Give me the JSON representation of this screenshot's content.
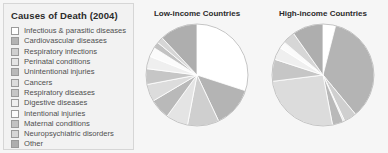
{
  "legend": {
    "title": "Causes of Death (2004)",
    "items": [
      {
        "label": "Infectious & parasitic diseases",
        "color": "#ffffff"
      },
      {
        "label": "Cardiovascular diseases",
        "color": "#b4b4b4"
      },
      {
        "label": "Respiratory infections",
        "color": "#cfcfcf"
      },
      {
        "label": "Perinatal conditions",
        "color": "#e4e4e4"
      },
      {
        "label": "Unintentional injuries",
        "color": "#b9b9b9"
      },
      {
        "label": "Cancers",
        "color": "#dcdcdc"
      },
      {
        "label": "Respiratory diseases",
        "color": "#c6c6c6"
      },
      {
        "label": "Digestive diseases",
        "color": "#efefef"
      },
      {
        "label": "Intentional injuries",
        "color": "#fbfbfb"
      },
      {
        "label": "Maternal conditions",
        "color": "#c2c2c2"
      },
      {
        "label": "Neuropsychiatric disorders",
        "color": "#d6d6d6"
      },
      {
        "label": "Other",
        "color": "#aeaeae"
      }
    ]
  },
  "charts": [
    {
      "id": "low-income",
      "title": "Low-income Countries",
      "center": [
        61,
        52
      ],
      "radius": 51
    },
    {
      "id": "high-income",
      "title": "High-income Countries",
      "center": [
        61,
        52
      ],
      "radius": 51
    }
  ],
  "chart_data": [
    {
      "type": "pie",
      "title": "Low-income Countries",
      "categories": [
        "Infectious & parasitic diseases",
        "Cardiovascular diseases",
        "Respiratory infections",
        "Perinatal conditions",
        "Unintentional injuries",
        "Cancers",
        "Respiratory diseases",
        "Digestive diseases",
        "Intentional injuries",
        "Maternal conditions",
        "Neuropsychiatric disorders",
        "Other"
      ],
      "values": [
        30.0,
        13.0,
        10.0,
        7.0,
        6.5,
        5.5,
        5.0,
        4.0,
        3.0,
        2.0,
        2.0,
        12.0
      ],
      "unit": "percent",
      "colors": [
        "#ffffff",
        "#b4b4b4",
        "#cfcfcf",
        "#e4e4e4",
        "#b9b9b9",
        "#dcdcdc",
        "#c6c6c6",
        "#efefef",
        "#fbfbfb",
        "#c2c2c2",
        "#d6d6d6",
        "#aeaeae"
      ],
      "start_angle": 0,
      "direction": "clockwise",
      "legend_position": "left"
    },
    {
      "type": "pie",
      "title": "High-income Countries",
      "categories": [
        "Infectious & parasitic diseases",
        "Cardiovascular diseases",
        "Respiratory infections",
        "Perinatal conditions",
        "Unintentional injuries",
        "Cancers",
        "Respiratory diseases",
        "Digestive diseases",
        "Intentional injuries",
        "Maternal conditions",
        "Neuropsychiatric disorders",
        "Other"
      ],
      "values": [
        4.0,
        35.0,
        4.0,
        0.5,
        3.5,
        26.0,
        7.0,
        4.0,
        2.0,
        0.2,
        4.0,
        9.8
      ],
      "unit": "percent",
      "colors": [
        "#ffffff",
        "#b4b4b4",
        "#cfcfcf",
        "#e4e4e4",
        "#b9b9b9",
        "#dcdcdc",
        "#c6c6c6",
        "#efefef",
        "#fbfbfb",
        "#c2c2c2",
        "#d6d6d6",
        "#aeaeae"
      ],
      "start_angle": 0,
      "direction": "clockwise",
      "legend_position": "left"
    }
  ]
}
